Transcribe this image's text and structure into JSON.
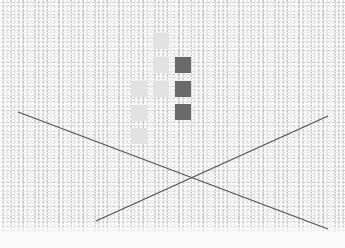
{
  "image": {
    "description": "Textured white stucco-like background with a grid of light and dark gray squares and two crossing dark lines forming an X",
    "background_color": "#ececec",
    "squares": [
      {
        "x": 153,
        "y": 33,
        "color": "#e2e2e2"
      },
      {
        "x": 153,
        "y": 57,
        "color": "#e2e2e2"
      },
      {
        "x": 175,
        "y": 57,
        "color": "#6a6a6a"
      },
      {
        "x": 131,
        "y": 81,
        "color": "#e2e2e2"
      },
      {
        "x": 153,
        "y": 81,
        "color": "#e2e2e2"
      },
      {
        "x": 175,
        "y": 81,
        "color": "#6a6a6a"
      },
      {
        "x": 131,
        "y": 105,
        "color": "#e2e2e2"
      },
      {
        "x": 175,
        "y": 104,
        "color": "#6a6a6a"
      },
      {
        "x": 131,
        "y": 128,
        "color": "#e2e2e2"
      }
    ],
    "lines": [
      {
        "x1": 18,
        "y1": 112,
        "x2": 328,
        "y2": 229,
        "color": "#555555"
      },
      {
        "x1": 96,
        "y1": 221,
        "x2": 328,
        "y2": 116,
        "color": "#555555"
      }
    ]
  }
}
